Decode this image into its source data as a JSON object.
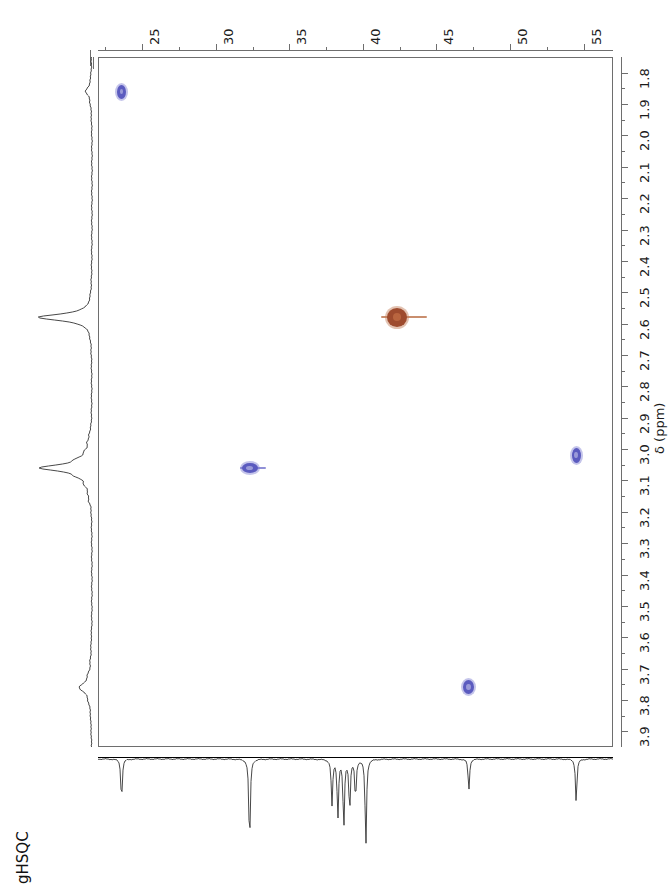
{
  "title": "gHSQC",
  "axes": {
    "x_axis": {
      "name": "13C",
      "label": "",
      "min": 22.0,
      "max": 57.0,
      "direction": "increasing-left-to-right",
      "major_ticks": [
        25,
        30,
        35,
        40,
        45,
        50,
        55
      ],
      "major_tick_labels": [
        "25",
        "30",
        "35",
        "40",
        "45",
        "50",
        "55"
      ],
      "minor_tick_step": 2.5
    },
    "y_axis": {
      "name": "1H",
      "label": "δ (ppm)",
      "min": 1.75,
      "max": 3.95,
      "direction": "increasing-top-to-bottom",
      "major_ticks": [
        1.8,
        1.9,
        2.0,
        2.1,
        2.2,
        2.3,
        2.4,
        2.5,
        2.6,
        2.7,
        2.8,
        2.9,
        3.0,
        3.1,
        3.2,
        3.3,
        3.4,
        3.5,
        3.6,
        3.7,
        3.8,
        3.9
      ],
      "major_tick_labels": [
        "1.8",
        "1.9",
        "2.0",
        "2.1",
        "2.2",
        "2.3",
        "2.4",
        "2.5",
        "2.6",
        "2.7",
        "2.8",
        "2.9",
        "3.0",
        "3.1",
        "3.2",
        "3.3",
        "3.4",
        "3.5",
        "3.6",
        "3.7",
        "3.8",
        "3.9"
      ]
    }
  },
  "colors": {
    "peak_blue": "#5b5bbf",
    "peak_blue_edge": "#7d7dd0",
    "peak_red": "#9e4b2e",
    "peak_red_edge": "#c07a55",
    "axis": "#6e6e6e",
    "trace": "#333333"
  },
  "chart_data": {
    "type": "scatter",
    "title": "gHSQC",
    "xlabel": "13C (ppm)",
    "ylabel": "δ (ppm)",
    "xlim": [
      22.0,
      57.0
    ],
    "ylim": [
      3.95,
      1.75
    ],
    "grid": false,
    "legend": "none",
    "series": [
      {
        "name": "cross-peaks-blue",
        "color": "#5b5bbf",
        "phase": "positive",
        "points": [
          {
            "id": "peak-1",
            "x13c": 23.6,
            "y1h": 1.86,
            "w": 9,
            "h": 14,
            "tail": 0
          },
          {
            "id": "peak-2",
            "x13c": 32.3,
            "y1h": 3.06,
            "w": 16,
            "h": 10,
            "tail": 26
          },
          {
            "id": "peak-3",
            "x13c": 54.5,
            "y1h": 3.02,
            "w": 9,
            "h": 15,
            "tail": 0
          },
          {
            "id": "peak-4",
            "x13c": 47.2,
            "y1h": 3.76,
            "w": 11,
            "h": 14,
            "tail": 0
          }
        ]
      },
      {
        "name": "cross-peaks-red",
        "color": "#9e4b2e",
        "phase": "negative",
        "points": [
          {
            "id": "peak-5",
            "x13c": 42.3,
            "y1h": 2.58,
            "w": 20,
            "h": 19,
            "tail": 46
          }
        ]
      }
    ],
    "projections": {
      "top_1d": {
        "axis": "13C",
        "orientation": "bottom-horizontal",
        "direction": "downward-peaks",
        "peak_positions_ppm": [
          23.6,
          32.3,
          38.1,
          38.6,
          39.1,
          39.6,
          42.3,
          47.2,
          54.5
        ]
      },
      "left_1d": {
        "axis": "1H",
        "orientation": "left-vertical",
        "direction": "leftward-peaks",
        "peak_positions_ppm": [
          2.58,
          3.06,
          3.76,
          1.86
        ]
      }
    }
  }
}
